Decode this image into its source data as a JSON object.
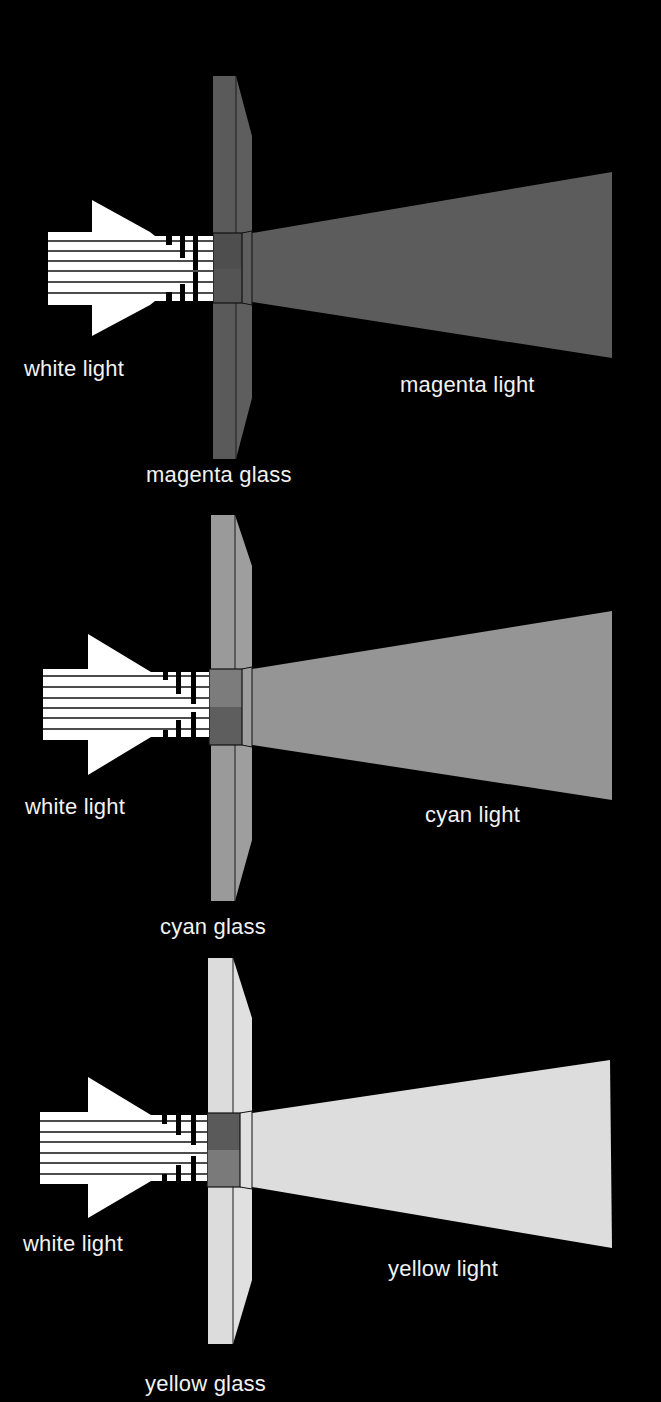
{
  "diagram": {
    "panels": [
      {
        "id": "magenta",
        "input_label": "white light",
        "glass_label": "magenta glass",
        "output_label": "magenta light",
        "colors": {
          "glass": "#5a5a5a",
          "glass_overlap_top": "#4e4e4e",
          "glass_overlap_bottom": "#545454",
          "beam": "#5c5c5c"
        }
      },
      {
        "id": "cyan",
        "input_label": "white light",
        "glass_label": "cyan glass",
        "output_label": "cyan light",
        "colors": {
          "glass": "#9a9a9a",
          "glass_overlap_top": "#7c7c7c",
          "glass_overlap_bottom": "#5e5e5e",
          "beam": "#959595"
        }
      },
      {
        "id": "yellow",
        "input_label": "white light",
        "glass_label": "yellow glass",
        "output_label": "yellow light",
        "colors": {
          "glass": "#dcdcdc",
          "glass_overlap_top": "#5a5a5a",
          "glass_overlap_bottom": "#7a7a7a",
          "beam": "#dddddd"
        }
      }
    ],
    "arrow_color": "#ffffff",
    "background": "#000000"
  }
}
